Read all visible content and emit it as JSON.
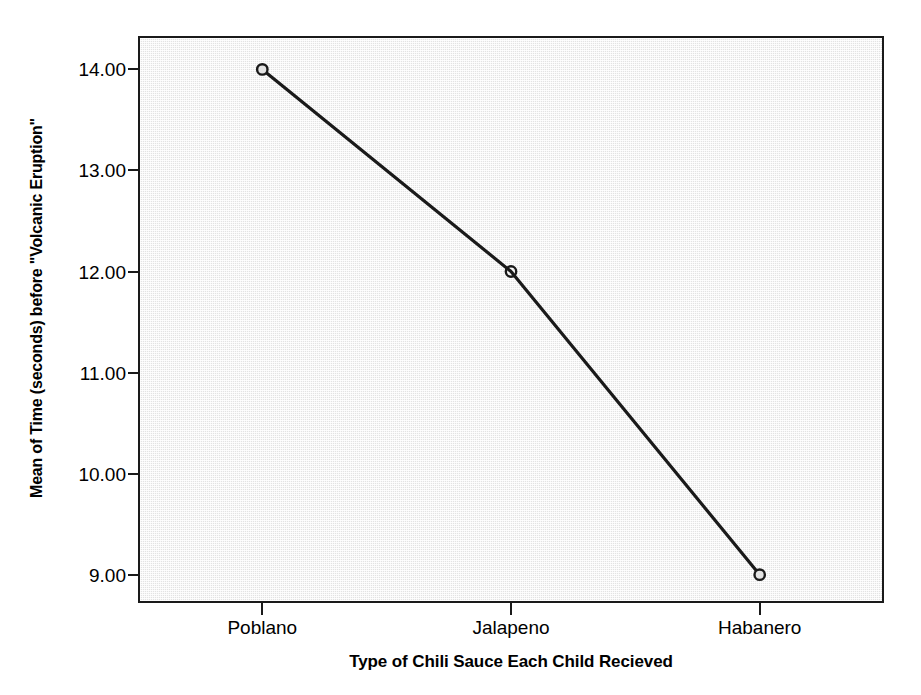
{
  "chart_data": {
    "type": "line",
    "title": "",
    "xlabel": "Type of Chili Sauce Each Child Recieved",
    "ylabel": "Mean of Time (seconds) before \"Volcanic Eruption\"",
    "categories": [
      "Poblano",
      "Jalapeno",
      "Habanero"
    ],
    "values": [
      14.0,
      12.0,
      9.0
    ],
    "series": [
      {
        "name": "Mean of Time (seconds) before \"Volcanic Eruption\"",
        "values": [
          14.0,
          12.0,
          9.0
        ]
      }
    ],
    "y_tick_labels": [
      "14.00",
      "13.00",
      "12.00",
      "11.00",
      "10.00",
      "9.00"
    ],
    "y_ticks": [
      14,
      13,
      12,
      11,
      10,
      9
    ],
    "ylim": [
      8.72,
      14.33
    ],
    "grid": false,
    "legend": "none",
    "marker": "open-circle",
    "line_color": "#1a1a1a",
    "plot_background": "#e3e3e3",
    "axis_color": "#1a1a1a"
  },
  "axes": {
    "y_title": "Mean of Time (seconds) before \"Volcanic Eruption\"",
    "x_title": "Type of Chili Sauce Each Child Recieved",
    "y_labels": {
      "t14": "14.00",
      "t13": "13.00",
      "t12": "12.00",
      "t11": "11.00",
      "t10": "10.00",
      "t9": "9.00"
    },
    "x_labels": {
      "c0": "Poblano",
      "c1": "Jalapeno",
      "c2": "Habanero"
    }
  }
}
